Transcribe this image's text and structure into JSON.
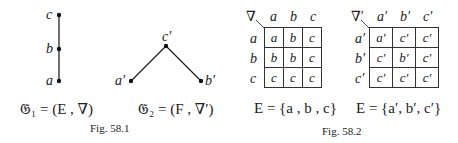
{
  "fig1": {
    "chain": {
      "labels": [
        "c",
        "b",
        "a"
      ]
    },
    "vee": {
      "top": "c′",
      "left": "a′",
      "right": "b′"
    },
    "eq1": "𝔊₁ = (E , ∇)",
    "eq2": "𝔊₂ = (F , ∇′)",
    "caption": "Fig. 58.1"
  },
  "fig2": {
    "table1": {
      "op": "∇",
      "cols": [
        "a",
        "b",
        "c"
      ],
      "rows": [
        "a",
        "b",
        "c"
      ],
      "cells": [
        [
          "a",
          "b",
          "c"
        ],
        [
          "b",
          "b",
          "c"
        ],
        [
          "c",
          "c",
          "c"
        ]
      ]
    },
    "table2": {
      "op": "∇′",
      "cols": [
        "a′",
        "b′",
        "c′"
      ],
      "rows": [
        "a′",
        "b′",
        "c′"
      ],
      "cells": [
        [
          "a′",
          "c′",
          "c′"
        ],
        [
          "c′",
          "b′",
          "c′"
        ],
        [
          "c′",
          "c′",
          "c′"
        ]
      ]
    },
    "set1": "E = {a , b , c}",
    "set2": "E = {a′, b′, c′}",
    "caption": "Fig. 58.2"
  }
}
